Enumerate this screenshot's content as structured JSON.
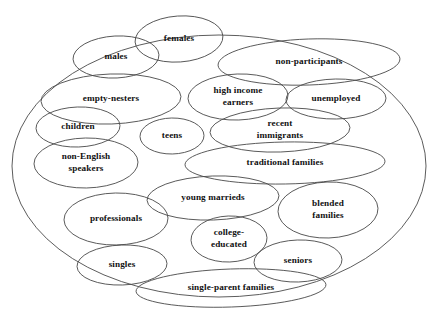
{
  "diagram": {
    "type": "venn-cluster-ellipses",
    "title": "",
    "boundary": {
      "name": "market-universe-boundary",
      "cx": 219,
      "cy": 166,
      "rx": 207,
      "ry": 131,
      "rotation": 0
    },
    "stroke_color": "#4a4a4a",
    "text_color": "#111111",
    "background_color": "#ffffff",
    "segments": [
      {
        "id": "females",
        "label": "females",
        "lines": [
          "females"
        ],
        "cx": 179,
        "cy": 39,
        "rx": 44,
        "ry": 23,
        "rot": -4
      },
      {
        "id": "males",
        "label": "males",
        "lines": [
          "males"
        ],
        "cx": 116,
        "cy": 57,
        "rx": 43,
        "ry": 21,
        "rot": -3
      },
      {
        "id": "non-participants",
        "label": "non-participants",
        "lines": [
          "non-participants"
        ],
        "cx": 309,
        "cy": 62,
        "rx": 91,
        "ry": 23,
        "rot": -2
      },
      {
        "id": "empty-nesters",
        "label": "empty-nesters",
        "lines": [
          "empty-nesters"
        ],
        "cx": 111,
        "cy": 99,
        "rx": 70,
        "ry": 25,
        "rot": -2
      },
      {
        "id": "high-income-earners",
        "label": "high income earners",
        "lines": [
          "high income",
          "earners"
        ],
        "cx": 238,
        "cy": 97,
        "rx": 50,
        "ry": 23,
        "rot": -2
      },
      {
        "id": "unemployed",
        "label": "unemployed",
        "lines": [
          "unemployed"
        ],
        "cx": 336,
        "cy": 99,
        "rx": 50,
        "ry": 20,
        "rot": -1
      },
      {
        "id": "children",
        "label": "children",
        "lines": [
          "children"
        ],
        "cx": 78,
        "cy": 127,
        "rx": 42,
        "ry": 20,
        "rot": -2
      },
      {
        "id": "teens",
        "label": "teens",
        "lines": [
          "teens"
        ],
        "cx": 172,
        "cy": 136,
        "rx": 32,
        "ry": 18,
        "rot": -1
      },
      {
        "id": "recent-immigrants",
        "label": "recent immigrants",
        "lines": [
          "recent",
          "immigrants"
        ],
        "cx": 280,
        "cy": 130,
        "rx": 70,
        "ry": 22,
        "rot": -2
      },
      {
        "id": "non-english-speakers",
        "label": "non-English speakers",
        "lines": [
          "non-English",
          "speakers"
        ],
        "cx": 86,
        "cy": 163,
        "rx": 52,
        "ry": 25,
        "rot": -1
      },
      {
        "id": "traditional-families",
        "label": "traditional families",
        "lines": [
          "traditional families"
        ],
        "cx": 285,
        "cy": 163,
        "rx": 100,
        "ry": 21,
        "rot": -1
      },
      {
        "id": "young-marrieds",
        "label": "young marrieds",
        "lines": [
          "young marrieds"
        ],
        "cx": 213,
        "cy": 198,
        "rx": 66,
        "ry": 22,
        "rot": -2
      },
      {
        "id": "blended-families",
        "label": "blended families",
        "lines": [
          "blended",
          "families"
        ],
        "cx": 328,
        "cy": 210,
        "rx": 50,
        "ry": 28,
        "rot": -2
      },
      {
        "id": "professionals",
        "label": "professionals",
        "lines": [
          "professionals"
        ],
        "cx": 116,
        "cy": 219,
        "rx": 52,
        "ry": 26,
        "rot": -1
      },
      {
        "id": "college-educated",
        "label": "college-educated",
        "lines": [
          "college-",
          "educated"
        ],
        "cx": 229,
        "cy": 239,
        "rx": 38,
        "ry": 23,
        "rot": -2
      },
      {
        "id": "seniors",
        "label": "seniors",
        "lines": [
          "seniors"
        ],
        "cx": 298,
        "cy": 261,
        "rx": 44,
        "ry": 21,
        "rot": -2
      },
      {
        "id": "singles",
        "label": "singles",
        "lines": [
          "singles"
        ],
        "cx": 122,
        "cy": 265,
        "rx": 45,
        "ry": 20,
        "rot": -2
      },
      {
        "id": "single-parent-families",
        "label": "single-parent families",
        "lines": [
          "single-parent families"
        ],
        "cx": 231,
        "cy": 288,
        "rx": 95,
        "ry": 19,
        "rot": -2
      }
    ]
  }
}
